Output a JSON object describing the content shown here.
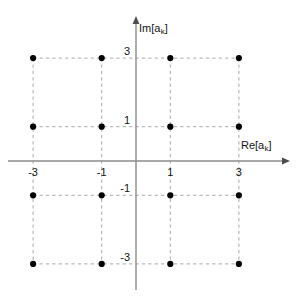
{
  "figure": {
    "kind": "constellation-diagram",
    "background_color": "#ffffff",
    "axis_color": "#8c8c8c",
    "grid_color": "#a8a8a8",
    "point_color": "#000000",
    "text_color": "#141414"
  },
  "axes": {
    "x_label_text": "Re[a",
    "x_label_sub": "k",
    "x_label_close": "]",
    "y_label_text": "Im[a",
    "y_label_sub": "k",
    "y_label_close": "]",
    "x_ticks": [
      "-3",
      "-1",
      "1",
      "3"
    ],
    "y_ticks": [
      "3",
      "1",
      "-1",
      "-3"
    ],
    "origin_px": {
      "x": 136,
      "y": 161
    },
    "unit_px": 34.3,
    "x_axis_start_px": 8,
    "x_axis_end_px": 290,
    "y_axis_top_px": 16,
    "y_axis_bottom_px": 290
  },
  "chart_data": {
    "type": "scatter",
    "title": "",
    "xlabel": "Re[a_k]",
    "ylabel": "Im[a_k]",
    "xlim": [
      -3.7,
      4.5
    ],
    "ylim": [
      -3.7,
      4.2
    ],
    "xticks": [
      -3,
      -1,
      1,
      3
    ],
    "yticks": [
      3,
      1,
      -1,
      -3
    ],
    "grid": true,
    "grid_style": "dashed",
    "legend": null,
    "series": [
      {
        "name": "16-QAM constellation points",
        "marker": "filled-circle",
        "color": "#000000",
        "points": [
          {
            "x": -3,
            "y": 3
          },
          {
            "x": -1,
            "y": 3
          },
          {
            "x": 1,
            "y": 3
          },
          {
            "x": 3,
            "y": 3
          },
          {
            "x": -3,
            "y": 1
          },
          {
            "x": -1,
            "y": 1
          },
          {
            "x": 1,
            "y": 1
          },
          {
            "x": 3,
            "y": 1
          },
          {
            "x": -3,
            "y": -1
          },
          {
            "x": -1,
            "y": -1
          },
          {
            "x": 1,
            "y": -1
          },
          {
            "x": 3,
            "y": -1
          },
          {
            "x": -3,
            "y": -3
          },
          {
            "x": -1,
            "y": -3
          },
          {
            "x": 1,
            "y": -3
          },
          {
            "x": 3,
            "y": -3
          }
        ]
      }
    ]
  }
}
